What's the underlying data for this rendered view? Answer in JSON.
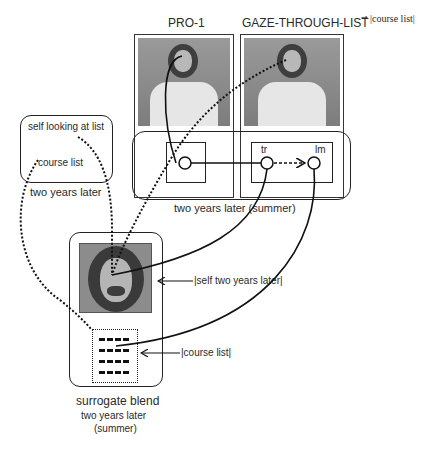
{
  "diagram": {
    "colors": {
      "line": "#111111",
      "photo_bg": "#8f8f8f",
      "photo_dark": "#555555",
      "text": "#2a2a2a"
    },
    "top_panels": {
      "pro1_title": "PRO-1",
      "gaze_title": "GAZE-THROUGH-LIST",
      "gaze_annotation_symbol": "⇝",
      "gaze_annotation": "|course list|"
    },
    "blend_space": {
      "nodes": [
        "tr",
        "lm"
      ],
      "label": "two years later (summer)"
    },
    "input_space_left": {
      "inner_labels": [
        "self looking at list",
        "course list"
      ],
      "label": "two years later"
    },
    "surrogate": {
      "self_pointer": "|self two years later|",
      "list_pointer": "|course list|",
      "title": "surrogate blend",
      "subtitle_1": "two years later",
      "subtitle_2": "(summer)"
    }
  }
}
